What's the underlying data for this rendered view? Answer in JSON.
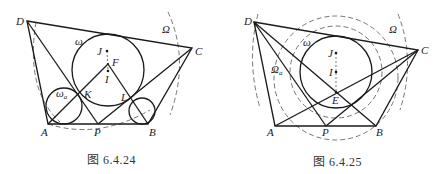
{
  "figures": [
    {
      "caption": "图 6.4.24",
      "labels": {
        "D": "D",
        "C": "C",
        "A": "A",
        "B": "B",
        "P": "P",
        "K": "K",
        "L": "L",
        "F": "F",
        "J": "J",
        "I": "I",
        "omega": "ω",
        "omega_a": "ω",
        "omega_a_sub": "a",
        "Omega": "Ω"
      }
    },
    {
      "caption": "图 6.4.25",
      "labels": {
        "D": "D",
        "C": "C",
        "A": "A",
        "B": "B",
        "P": "P",
        "E": "E",
        "J": "J",
        "I": "I",
        "omega": "ω",
        "Omega_a": "Ω",
        "Omega_a_sub": "a",
        "Omega": "Ω"
      }
    }
  ]
}
